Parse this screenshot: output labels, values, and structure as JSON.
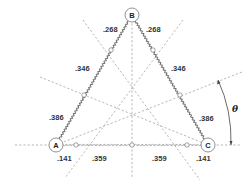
{
  "diagram": {
    "type": "triangular spring network",
    "nodes": [
      {
        "id": "A",
        "label": "A",
        "x": 56,
        "y": 145
      },
      {
        "id": "B",
        "label": "B",
        "x": 132,
        "y": 15
      },
      {
        "id": "C",
        "label": "C",
        "x": 208,
        "y": 145
      }
    ],
    "edge_labels": {
      "ab_upper": ".268",
      "bc_upper": ".268",
      "ab_middle": ".346",
      "bc_middle": ".346",
      "ab_lower": ".386",
      "bc_lower": ".386",
      "ac_left_end": ".141",
      "ac_left_mid": ".359",
      "ac_right_mid": ".359",
      "ac_right_end": ".141"
    },
    "angle_label": "θ",
    "colors": {
      "line": "#555555",
      "dashed": "#9a9a9a",
      "background": "#ffffff"
    }
  }
}
